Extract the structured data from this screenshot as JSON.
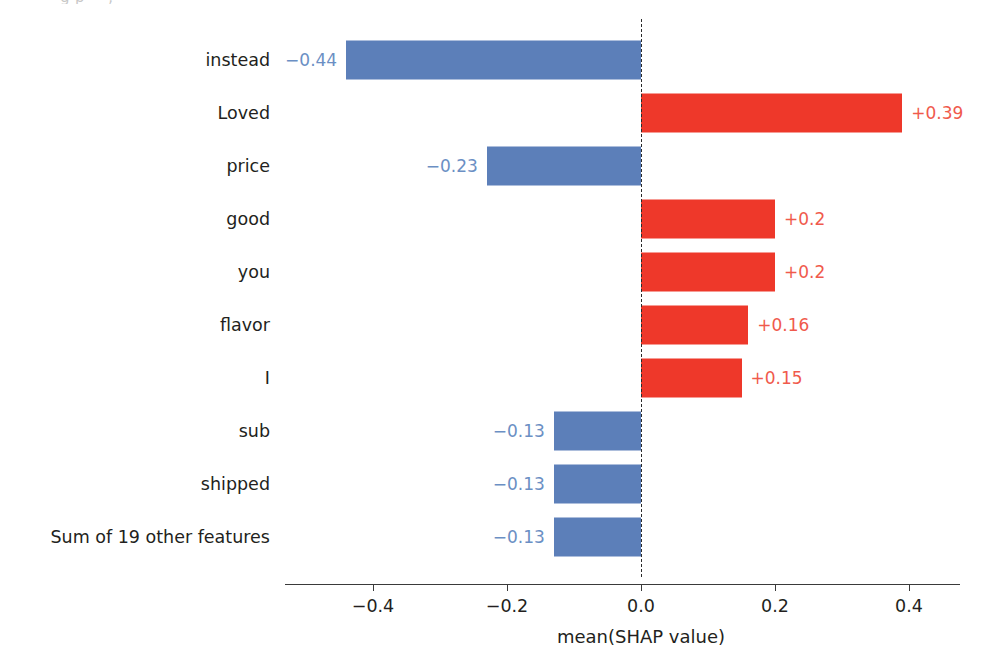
{
  "figure": {
    "top_bleed_text": "g                                                  p      =            ,"
  },
  "chart_data": {
    "type": "bar",
    "orientation": "horizontal",
    "title": "",
    "xlabel": "mean(SHAP value)",
    "ylabel": "",
    "categories": [
      "instead",
      "Loved",
      "price",
      "good",
      "you",
      "flavor",
      "I",
      "sub",
      "shipped",
      "Sum of 19 other features"
    ],
    "values": [
      -0.44,
      0.39,
      -0.23,
      0.2,
      0.2,
      0.16,
      0.15,
      -0.13,
      -0.13,
      -0.13
    ],
    "value_labels": [
      "−0.44",
      "+0.39",
      "−0.23",
      "+0.2",
      "+0.2",
      "+0.16",
      "+0.15",
      "−0.13",
      "−0.13",
      "−0.13"
    ],
    "xlim": [
      -0.52,
      0.48
    ],
    "xticks": [
      -0.4,
      -0.2,
      0.0,
      0.2,
      0.4
    ],
    "xticklabels": [
      "−0.4",
      "−0.2",
      "0.0",
      "0.2",
      "0.4"
    ],
    "grid": false,
    "legend": null,
    "zero_reference_line": true,
    "colors": {
      "negative_bar": "#5c7fb9",
      "positive_bar": "#ee382a",
      "negative_label": "#6b8fc4",
      "positive_label": "#f05a4c",
      "axis": "#3a3a3a",
      "text": "#231f20",
      "background": "#ffffff"
    }
  }
}
